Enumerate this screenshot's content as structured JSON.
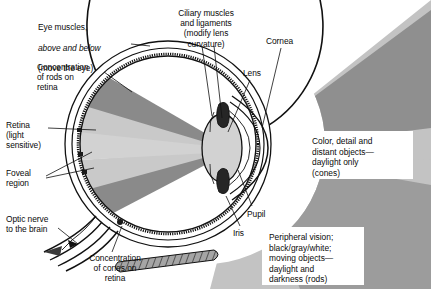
{
  "figure": {
    "background_color": "#ffffff",
    "text_color": "#0a0a0a"
  },
  "palette": {
    "light_field_outer": "#c0c0c0",
    "light_field_inner": "#8f8f8f",
    "interior_light": "#c9c9c9",
    "interior_dark": "#8a8a8a",
    "sclera_fill": "#ffffff",
    "choroid_fill": "#b8b8b8",
    "outline": "#111111",
    "muscle_fill": "#9a9a9a",
    "lens_fill": "#d2d2d2",
    "iris_fill": "#2b2b2b"
  },
  "labels": [
    {
      "id": "eye-muscles",
      "line1": "Eye muscles,",
      "line2": "above and below",
      "line3": "(move the eye)",
      "x": 38,
      "y": 12,
      "align": "left"
    },
    {
      "id": "ciliary-muscles",
      "text": "Ciliary muscles\nand ligaments\n(modify lens\ncurvature)",
      "x": 166,
      "y": 8,
      "align": "center"
    },
    {
      "id": "cornea",
      "text": "Cornea",
      "x": 266,
      "y": 36,
      "align": "left"
    },
    {
      "id": "concentration-rods",
      "text": "Concentration\nof rods on\nretina",
      "x": 37,
      "y": 62,
      "align": "left"
    },
    {
      "id": "lens",
      "text": "Lens",
      "x": 243,
      "y": 68,
      "align": "left"
    },
    {
      "id": "retina",
      "text": "Retina\n(light\nsensitive)",
      "x": 6,
      "y": 120,
      "align": "left"
    },
    {
      "id": "foveal-region",
      "text": "Foveal\nregion",
      "x": 6,
      "y": 168,
      "align": "left"
    },
    {
      "id": "pupil",
      "text": "Pupil",
      "x": 247,
      "y": 209,
      "align": "left"
    },
    {
      "id": "optic-nerve",
      "text": "Optic nerve\nto the brain",
      "x": 6,
      "y": 214,
      "align": "left"
    },
    {
      "id": "iris",
      "text": "Iris",
      "x": 233,
      "y": 228,
      "align": "left"
    },
    {
      "id": "concentration-cones",
      "text": "Concentration\nof cones on\nretina",
      "x": 75,
      "y": 253,
      "align": "center"
    }
  ],
  "callout_boxes": [
    {
      "id": "cones-box",
      "text": "Color, detail and\ndistant objects—\ndaylight only\n(cones)",
      "x": 305,
      "y": 131,
      "width": 108,
      "height": 48
    },
    {
      "id": "rods-box",
      "text": "Peripheral vision;\nblack/gray/white;\nmoving objects—\ndaylight and\ndarkness (rods)",
      "x": 262,
      "y": 227,
      "width": 102,
      "height": 58
    }
  ],
  "anatomy_parts": [
    "eye-muscle-upper",
    "eye-muscle-lower",
    "sclera",
    "choroid",
    "retina-layer",
    "cornea",
    "lens",
    "iris-upper",
    "iris-lower",
    "ciliary-body",
    "optic-nerve",
    "foveal-region",
    "light-cone-external",
    "light-cone-internal"
  ]
}
